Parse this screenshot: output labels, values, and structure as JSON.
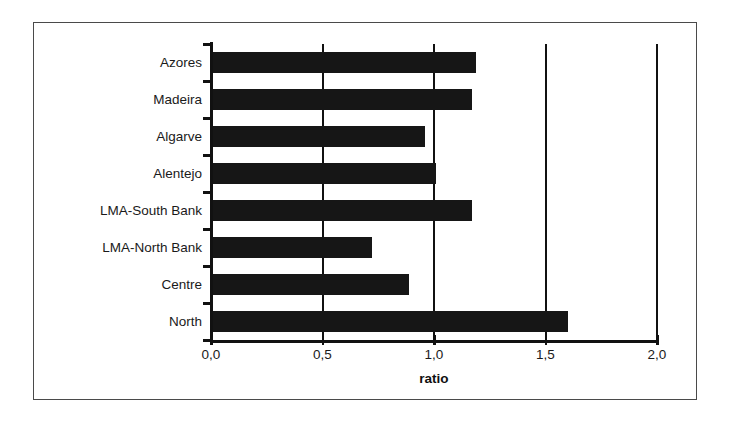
{
  "chart_data": {
    "type": "bar",
    "orientation": "horizontal",
    "title": "",
    "subtitle": "",
    "xlabel": "ratio",
    "ylabel": "",
    "categories": [
      "Azores",
      "Madeira",
      "Algarve",
      "Alentejo",
      "LMA-South Bank",
      "LMA-North Bank",
      "Centre",
      "North"
    ],
    "values": [
      1.19,
      1.17,
      0.96,
      1.01,
      1.17,
      0.72,
      0.89,
      1.6
    ],
    "series": [
      {
        "name": "ratio",
        "values": [
          1.19,
          1.17,
          0.96,
          1.01,
          1.17,
          0.72,
          0.89,
          1.6
        ]
      }
    ],
    "xlim": [
      0.0,
      2.0
    ],
    "xticks": [
      0.0,
      0.5,
      1.0,
      1.5,
      2.0
    ],
    "xtick_labels": [
      "0,0",
      "0,5",
      "1,0",
      "1,5",
      "2,0"
    ],
    "grid": "vertical",
    "legend": "none",
    "bar_color": "#161616",
    "axis_color": "#111111",
    "decimal_separator": ","
  },
  "figure": {
    "frame_color": "#4a4a4a",
    "background": "#ffffff"
  }
}
